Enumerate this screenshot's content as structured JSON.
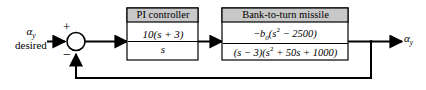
{
  "diagram": {
    "type": "control-system-block-diagram",
    "background_color": "#ffffff",
    "line_color": "#000000",
    "header_fill_color": "#c8c8c8",
    "block_fill_color": "#ffffff"
  },
  "input": {
    "symbol_line1": "αy",
    "symbol_line2": "desired",
    "alpha": "α",
    "subscript": "y"
  },
  "summing_junction": {
    "name": "summing-junction",
    "positive_sign": "+",
    "negative_sign": "−",
    "reference_input_sign": "+",
    "feedback_input_sign": "−"
  },
  "blocks": [
    {
      "id": "pi-controller",
      "title": "PI controller",
      "numerator": "10(s + 3)",
      "denominator": "s",
      "transfer_function": "10(s + 3) / s"
    },
    {
      "id": "bank-to-turn-missile",
      "title": "Bank-to-turn missile",
      "numerator": "−b0(s² − 2500)",
      "numerator_parts": {
        "sign": "−",
        "gain": "b",
        "gain_subscript": "0",
        "poly": "(s² − 2500)"
      },
      "denominator": "(s − 3)(s² + 50s + 1000)",
      "transfer_function": "−b0(s² − 2500) / [(s − 3)(s² + 50s + 1000)]"
    }
  ],
  "output": {
    "symbol": "αy",
    "alpha": "α",
    "subscript": "y"
  },
  "feedback": {
    "path": "unity-feedback",
    "gain": "1"
  }
}
